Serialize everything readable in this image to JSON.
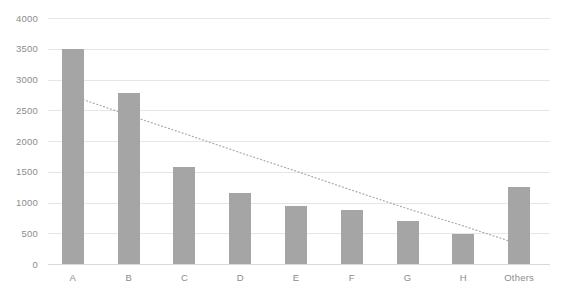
{
  "chart_data": {
    "type": "bar",
    "title": "",
    "subtitle": "",
    "xlabel": "",
    "ylabel": "",
    "categories": [
      "A",
      "B",
      "C",
      "D",
      "E",
      "F",
      "G",
      "H",
      "Others"
    ],
    "values": [
      3500,
      2780,
      1570,
      1150,
      950,
      870,
      700,
      490,
      1250
    ],
    "series": [
      {
        "name": "Values",
        "values": [
          3500,
          2780,
          1570,
          1150,
          950,
          870,
          700,
          490,
          1250
        ],
        "color": "#a5a5a5"
      }
    ],
    "ylim": [
      0,
      4000
    ],
    "yticks": [
      0,
      500,
      1000,
      1500,
      2000,
      2500,
      3000,
      3500,
      4000
    ],
    "ytick_labels": [
      "0",
      "500",
      "1000",
      "1500",
      "2000",
      "2500",
      "3000",
      "3500",
      "4000"
    ],
    "grid": true,
    "grid_axis": "y",
    "legend": false,
    "legend_position": "none",
    "trendline": {
      "name": "Linear trendline",
      "style": "dotted",
      "color": "#a8a8a8",
      "start": {
        "x_category": "A",
        "value": 2730
      },
      "end": {
        "x_category": "Others",
        "value": 320
      },
      "points": [
        {
          "x_category": "A",
          "value": 2730
        },
        {
          "x_category": "B",
          "value": 2420
        },
        {
          "x_category": "C",
          "value": 2120
        },
        {
          "x_category": "D",
          "value": 1810
        },
        {
          "x_category": "E",
          "value": 1510
        },
        {
          "x_category": "F",
          "value": 1200
        },
        {
          "x_category": "G",
          "value": 900
        },
        {
          "x_category": "H",
          "value": 620
        },
        {
          "x_category": "Others",
          "value": 320
        }
      ]
    },
    "colors": {
      "bar": "#a5a5a5",
      "gridline": "#e6e6e6",
      "axis": "#d9d9d9",
      "tick_text": "#8c8c8c",
      "trendline": "#a8a8a8",
      "background": "#ffffff"
    }
  }
}
